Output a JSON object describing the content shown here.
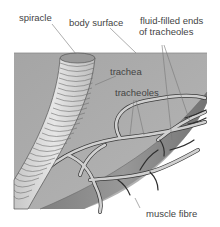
{
  "diagram": {
    "type": "biology-illustration",
    "labels": {
      "spiracle": "spiracle",
      "body_surface": "body surface",
      "fluid_ends_line1": "fluid-filled ends",
      "fluid_ends_line2": "of tracheoles",
      "trachea": "trachea",
      "tracheoles": "tracheoles",
      "muscle_fibre": "muscle fibre"
    },
    "colors": {
      "tissue": "#a9a9a9",
      "surface_edge": "#8a8a8a",
      "trachea_fill": "#d4d4d4",
      "trachea_rings": "#6e6e6e",
      "tracheole_fill": "#d0d0d0",
      "tracheole_outline": "#3a3a3a",
      "muscle": "#8c8c8c",
      "leader_line": "#777777",
      "text": "#444444"
    }
  }
}
